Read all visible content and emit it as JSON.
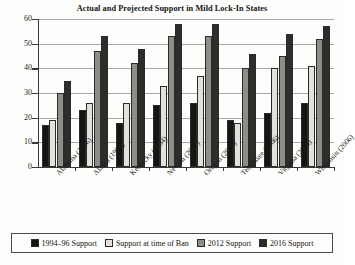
{
  "chart_data": {
    "type": "bar",
    "title": "Actual and Projected Support in Mild Lock-In States",
    "xlabel": "",
    "ylabel": "",
    "ylim": [
      0,
      60
    ],
    "yticks": [
      0,
      10,
      20,
      30,
      40,
      50,
      60
    ],
    "grid": true,
    "legend_position": "bottom",
    "categories": [
      "Alabama (2006)",
      "Alaska (1998)",
      "Kentucky (2004)",
      "Nevada (2002)",
      "Oregon (2004)",
      "Tennessee (2006)",
      "Virginia (2006)",
      "Wisconsin (2006)"
    ],
    "series": [
      {
        "name": "1994–96 Support",
        "color": "#151515",
        "values": [
          17,
          23,
          18,
          25,
          26,
          19,
          22,
          26
        ]
      },
      {
        "name": "Support at time of Ban",
        "color": "#e3e1dc",
        "values": [
          19,
          26,
          26,
          33,
          37,
          18,
          40,
          41
        ]
      },
      {
        "name": "2012 Support",
        "color": "#8d8d8a",
        "values": [
          30,
          47,
          42,
          53,
          53,
          40,
          45,
          52
        ]
      },
      {
        "name": "2016 Support",
        "color": "#2d2d2b",
        "values": [
          35,
          53,
          48,
          58,
          58,
          46,
          54,
          57
        ]
      }
    ]
  }
}
